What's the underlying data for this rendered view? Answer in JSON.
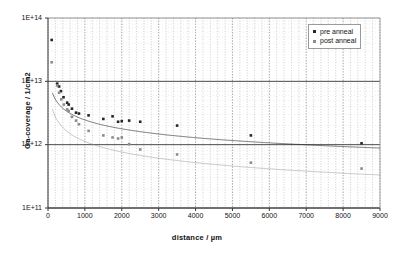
{
  "chart_data": {
    "type": "scatter",
    "title": "",
    "xlabel": "distance / µm",
    "ylabel": "Ga-coverage / 1/cm2",
    "xlim": [
      0,
      9000
    ],
    "ylim": [
      100000000000.0,
      100000000000000.0
    ],
    "yscale": "log",
    "xscale": "linear",
    "grid": "major horizontal solid, minor vertical dotted",
    "legend_position": "top-right",
    "xticks": [
      "0",
      "1000",
      "2000",
      "3000",
      "4000",
      "5000",
      "6000",
      "7000",
      "8000",
      "9000"
    ],
    "xtick_values": [
      0,
      1000,
      2000,
      3000,
      4000,
      5000,
      6000,
      7000,
      8000,
      9000
    ],
    "yticks": [
      "1E+11",
      "1E+12",
      "1E+13",
      "1E+14"
    ],
    "ytick_values": [
      100000000000.0,
      1000000000000.0,
      10000000000000.0,
      100000000000000.0
    ],
    "series": [
      {
        "name": "pre anneal",
        "color": "#262626",
        "marker": "square",
        "points": [
          [
            100,
            45000000000000.0
          ],
          [
            250,
            9200000000000.0
          ],
          [
            300,
            8300000000000.0
          ],
          [
            350,
            7000000000000.0
          ],
          [
            420,
            5600000000000.0
          ],
          [
            520,
            4600000000000.0
          ],
          [
            560,
            4300000000000.0
          ],
          [
            650,
            3700000000000.0
          ],
          [
            760,
            3200000000000.0
          ],
          [
            840,
            3100000000000.0
          ],
          [
            1100,
            2900000000000.0
          ],
          [
            1500,
            2550000000000.0
          ],
          [
            1750,
            2800000000000.0
          ],
          [
            1900,
            2300000000000.0
          ],
          [
            2000,
            2350000000000.0
          ],
          [
            2200,
            2400000000000.0
          ],
          [
            2500,
            2300000000000.0
          ],
          [
            3500,
            2000000000000.0
          ],
          [
            5500,
            1400000000000.0
          ],
          [
            8500,
            1050000000000.0
          ]
        ],
        "trend": {
          "type": "power",
          "a": 61000000000000.0,
          "b": -0.465
        }
      },
      {
        "name": "post anneal",
        "color": "#8c8c8c",
        "marker": "square",
        "points": [
          [
            100,
            20000000000000.0
          ],
          [
            250,
            8600000000000.0
          ],
          [
            300,
            6600000000000.0
          ],
          [
            360,
            5200000000000.0
          ],
          [
            430,
            4300000000000.0
          ],
          [
            520,
            3600000000000.0
          ],
          [
            560,
            3400000000000.0
          ],
          [
            650,
            2750000000000.0
          ],
          [
            760,
            2400000000000.0
          ],
          [
            840,
            2100000000000.0
          ],
          [
            1100,
            1650000000000.0
          ],
          [
            1500,
            1400000000000.0
          ],
          [
            1750,
            1300000000000.0
          ],
          [
            1900,
            1250000000000.0
          ],
          [
            2000,
            1300000000000.0
          ],
          [
            2200,
            1020000000000.0
          ],
          [
            2500,
            840000000000.0
          ],
          [
            3500,
            700000000000.0
          ],
          [
            5500,
            520000000000.0
          ],
          [
            8500,
            420000000000.0
          ]
        ],
        "trend": {
          "type": "power",
          "a": 52000000000000.0,
          "b": -0.555
        }
      }
    ]
  },
  "axes": {
    "x_title": "distance / µm",
    "y_title": "Ga-coverage / 1/cm2"
  },
  "legend": {
    "entries": [
      {
        "label": "pre anneal",
        "color": "#262626"
      },
      {
        "label": "post anneal",
        "color": "#8c8c8c"
      }
    ]
  }
}
